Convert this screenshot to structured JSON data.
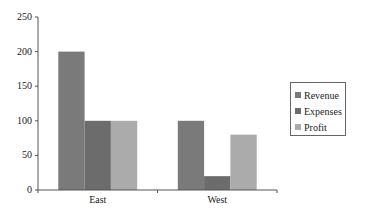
{
  "chart_data": {
    "type": "bar",
    "title": "",
    "xlabel": "",
    "ylabel": "",
    "categories": [
      "East",
      "West"
    ],
    "series": [
      {
        "name": "Revenue",
        "values": [
          200,
          100
        ],
        "color": "#7a7a7a"
      },
      {
        "name": "Expenses",
        "values": [
          100,
          20
        ],
        "color": "#6c6c6c"
      },
      {
        "name": "Profit",
        "values": [
          100,
          80
        ],
        "color": "#ababab"
      }
    ],
    "ylim": [
      0,
      250
    ],
    "yticks": [
      0,
      50,
      100,
      150,
      200,
      250
    ],
    "ytick_labels": [
      "0",
      "50",
      "100",
      "150",
      "200",
      "250"
    ],
    "grid": false,
    "legend_position": "right"
  },
  "legend": {
    "items": [
      {
        "label": "Revenue",
        "color": "#7a7a7a"
      },
      {
        "label": "Expenses",
        "color": "#6c6c6c"
      },
      {
        "label": "Profit",
        "color": "#ababab"
      }
    ]
  }
}
